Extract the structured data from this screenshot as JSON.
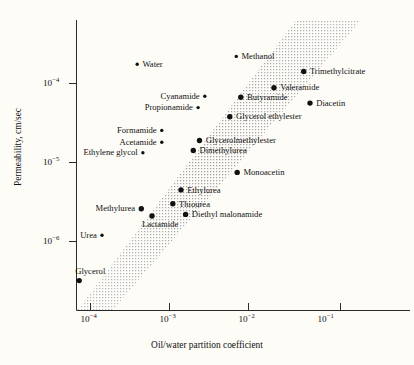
{
  "chart_data": {
    "type": "scatter",
    "title": "",
    "xlabel": "Oil/water partition coefficient",
    "ylabel": "Permeability, cm/sec",
    "xscale": "log",
    "yscale": "log",
    "xlim": [
      5e-05,
      0.6
    ],
    "ylim": [
      3e-07,
      0.0003
    ],
    "grid": false,
    "legend": null,
    "xticks": [
      {
        "value": 0.0001,
        "label": "10",
        "exponent": "−4"
      },
      {
        "value": 0.001,
        "label": "10",
        "exponent": "−3"
      },
      {
        "value": 0.01,
        "label": "10",
        "exponent": "−2"
      },
      {
        "value": 0.1,
        "label": "10",
        "exponent": "−1"
      }
    ],
    "yticks": [
      {
        "value": 0.0001,
        "label": "10",
        "exponent": "−4"
      },
      {
        "value": 1e-05,
        "label": "10",
        "exponent": "−5"
      },
      {
        "value": 1e-06,
        "label": "10",
        "exponent": "−6"
      }
    ],
    "band": {
      "name": "correlation band",
      "style": "stippled diagonal band",
      "color": "#b9b9b9",
      "description": "Broad stippled band running from lower-left to upper-right indicating the general correlation between oil/water partition coefficient and permeability"
    },
    "points": [
      {
        "label": "Water",
        "x": 0.00039,
        "y": 0.000175,
        "label_side": "right",
        "dot": "small"
      },
      {
        "label": "Methanol",
        "x": 0.007,
        "y": 0.00022,
        "label_side": "right",
        "dot": "small"
      },
      {
        "label": "Trimethylcitrate",
        "x": 0.05,
        "y": 0.000142,
        "label_side": "right",
        "dot": "large"
      },
      {
        "label": "Valeramide",
        "x": 0.021,
        "y": 8.85e-05,
        "label_side": "right",
        "dot": "large"
      },
      {
        "label": "Cyanamide",
        "x": 0.0028,
        "y": 6.9e-05,
        "label_side": "left",
        "dot": "small"
      },
      {
        "label": "Butyramide",
        "x": 0.008,
        "y": 6.7e-05,
        "label_side": "right",
        "dot": "large"
      },
      {
        "label": "Diacetin",
        "x": 0.06,
        "y": 5.65e-05,
        "label_side": "right",
        "dot": "large"
      },
      {
        "label": "Propionamide",
        "x": 0.0023,
        "y": 4.95e-05,
        "label_side": "left",
        "dot": "small"
      },
      {
        "label": "Glycerol ethylester",
        "x": 0.0058,
        "y": 3.8e-05,
        "label_side": "right",
        "dot": "large"
      },
      {
        "label": "Formamide",
        "x": 0.0008,
        "y": 2.55e-05,
        "label_side": "left",
        "dot": "small"
      },
      {
        "label": "Glycerolmethylester",
        "x": 0.0024,
        "y": 1.9e-05,
        "label_side": "right",
        "dot": "large"
      },
      {
        "label": "Acetamide",
        "x": 0.0008,
        "y": 1.8e-05,
        "label_side": "left",
        "dot": "small"
      },
      {
        "label": "Dimethylurea",
        "x": 0.002,
        "y": 1.42e-05,
        "label_side": "right",
        "dot": "large"
      },
      {
        "label": "Ethylene glycol",
        "x": 0.00046,
        "y": 1.33e-05,
        "label_side": "left",
        "dot": "small"
      },
      {
        "label": "Monoacetin",
        "x": 0.0072,
        "y": 7.5e-06,
        "label_side": "right",
        "dot": "large"
      },
      {
        "label": "Ethylurea",
        "x": 0.0014,
        "y": 4.5e-06,
        "label_side": "right",
        "dot": "large"
      },
      {
        "label": "Thiourea",
        "x": 0.0011,
        "y": 3e-06,
        "label_side": "right",
        "dot": "large"
      },
      {
        "label": "Methylurea",
        "x": 0.00044,
        "y": 2.6e-06,
        "label_side": "left",
        "dot": "large"
      },
      {
        "label": "Diethyl malonamide",
        "x": 0.0016,
        "y": 2.2e-06,
        "label_side": "right",
        "dot": "large"
      },
      {
        "label": "Lactamide",
        "x": 0.0006,
        "y": 2.1e-06,
        "label_side": "below",
        "dot": "large"
      },
      {
        "label": "Urea",
        "x": 0.00014,
        "y": 1.2e-06,
        "label_side": "left",
        "dot": "small"
      },
      {
        "label": "Glycerol",
        "x": 7.2e-05,
        "y": 3.2e-07,
        "label_side": "above",
        "dot": "large"
      }
    ]
  }
}
